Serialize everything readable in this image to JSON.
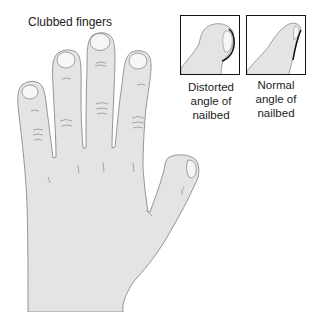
{
  "title": "Clubbed fingers",
  "insets": [
    {
      "label_line1": "Distorted",
      "label_line2": "angle of",
      "label_line3": "nailbed"
    },
    {
      "label_line1": "Normal",
      "label_line2": "angle of",
      "label_line3": "nailbed"
    }
  ],
  "colors": {
    "skin": "#e4e4e4",
    "outline": "#8a8a8a",
    "nail": "#f6f6f6",
    "nail_edge": "#111111"
  }
}
